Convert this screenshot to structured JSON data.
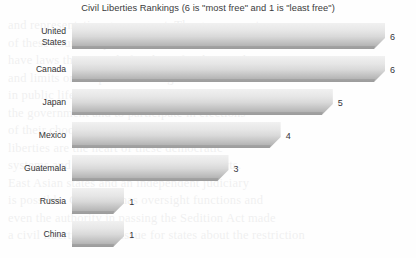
{
  "chart_data": {
    "type": "bar",
    "orientation": "horizontal",
    "title": "Civil Liberties Rankings (6 is \"most free\" and 1 is \"least free\")",
    "xlabel": "",
    "ylabel": "",
    "categories": [
      "United States",
      "Canada",
      "Japan",
      "Mexico",
      "Guatemala",
      "Russia",
      "China"
    ],
    "values": [
      6,
      6,
      5,
      4,
      3,
      1,
      1
    ],
    "value_labels": [
      "6",
      "6",
      "5",
      "4",
      "3",
      "1",
      "1"
    ],
    "xlim": [
      0,
      6
    ],
    "grid": false,
    "legend": false,
    "series": [
      {
        "name": "Civil Liberties Ranking",
        "values": [
          6,
          6,
          5,
          4,
          3,
          1,
          1
        ]
      }
    ],
    "points": [
      {
        "category": "United States",
        "category_line1": "United",
        "category_line2": "States",
        "value": 6,
        "label": "6"
      },
      {
        "category": "Canada",
        "category_line1": "Canada",
        "category_line2": "",
        "value": 6,
        "label": "6"
      },
      {
        "category": "Japan",
        "category_line1": "Japan",
        "category_line2": "",
        "value": 5,
        "label": "5"
      },
      {
        "category": "Mexico",
        "category_line1": "Mexico",
        "category_line2": "",
        "value": 4,
        "label": "4"
      },
      {
        "category": "Guatemala",
        "category_line1": "Guatemala",
        "category_line2": "",
        "value": 3,
        "label": "3"
      },
      {
        "category": "Russia",
        "category_line1": "Russia",
        "category_line2": "",
        "value": 1,
        "label": "1"
      },
      {
        "category": "China",
        "category_line1": "China",
        "category_line2": "",
        "value": 1,
        "label": "1"
      }
    ],
    "colors": {
      "bar_gradient_top": "#f1f1f1",
      "bar_gradient_mid": "#d9d9d9",
      "bar_gradient_bottom": "#a8a8a8",
      "bar_bevel": "#8f8f8f",
      "background": "#fefefe",
      "text": "#333335",
      "title_text": "#3a3a3c"
    }
  },
  "ghost_text": {
    "lines": [
      "and representative government. The governments",
      "of these countries protect their citizens and",
      "have laws that provide freedoms for the people",
      "and limits on the power of the government",
      "in public life. Citizens have the right to criticize",
      "the government and to participate in elections",
      "of their choosing. Individual rights and civil",
      "liberties are the heart of these democratic",
      "systems and they are protected by the courts.",
      "East Asian states and an independent judiciary",
      "is possible. Congress has oversight functions and",
      "even the authority in passing the Sedition Act made",
      "a civil liberty critical issue for states about the restriction"
    ]
  }
}
